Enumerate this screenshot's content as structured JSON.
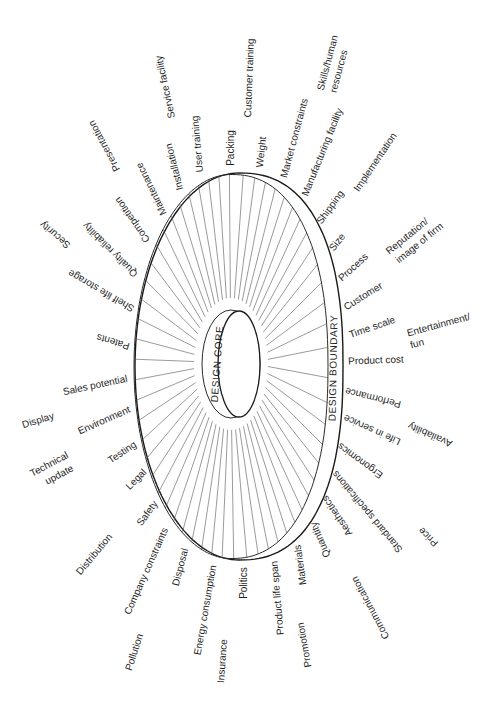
{
  "diagram": {
    "core_label": "DESIGN CORE",
    "boundary_label": "DESIGN BOUNDARY",
    "colors": {
      "ink": "#1f1f1f",
      "background": "#ffffff"
    },
    "labels": [
      {
        "text": "Customer training"
      },
      {
        "text": "Weight"
      },
      {
        "lines": [
          "Skills/human",
          "resources"
        ]
      },
      {
        "text": "Market constraints"
      },
      {
        "text": "Manufacturing facility"
      },
      {
        "text": "Implementation"
      },
      {
        "text": "Shipping"
      },
      {
        "text": "Size"
      },
      {
        "text": "Process"
      },
      {
        "lines": [
          "Reputation/",
          "image of firm"
        ]
      },
      {
        "text": "Customer"
      },
      {
        "text": "Time scale"
      },
      {
        "lines": [
          "Entertainment/",
          "fun"
        ]
      },
      {
        "text": "Product cost"
      },
      {
        "text": "Performance"
      },
      {
        "text": "Life in service"
      },
      {
        "text": "Availability"
      },
      {
        "text": "Ergonomics"
      },
      {
        "text": "Standard specifications"
      },
      {
        "text": "Price"
      },
      {
        "text": "Aesthetics"
      },
      {
        "text": "Quantity"
      },
      {
        "text": "Communication"
      },
      {
        "text": "Materials"
      },
      {
        "text": "Promotion"
      },
      {
        "text": "Product life span"
      },
      {
        "text": "Politics"
      },
      {
        "text": "Insurance"
      },
      {
        "text": "Energy consumption"
      },
      {
        "text": "Disposal"
      },
      {
        "text": "Pollution"
      },
      {
        "text": "Company constraints"
      },
      {
        "text": "Distribution"
      },
      {
        "text": "Safety"
      },
      {
        "text": "Legal"
      },
      {
        "lines": [
          "Technical",
          "update"
        ]
      },
      {
        "text": "Testing"
      },
      {
        "text": "Environment"
      },
      {
        "text": "Display"
      },
      {
        "text": "Sales potential"
      },
      {
        "text": "Patents"
      },
      {
        "text": "Shelf life storage"
      },
      {
        "text": "Security"
      },
      {
        "text": "Quality reliability"
      },
      {
        "text": "Competition"
      },
      {
        "text": "Presentation"
      },
      {
        "text": "Maintenance"
      },
      {
        "text": "Installation"
      },
      {
        "text": "Service facility"
      },
      {
        "text": "User training"
      },
      {
        "text": "Packing"
      }
    ]
  }
}
